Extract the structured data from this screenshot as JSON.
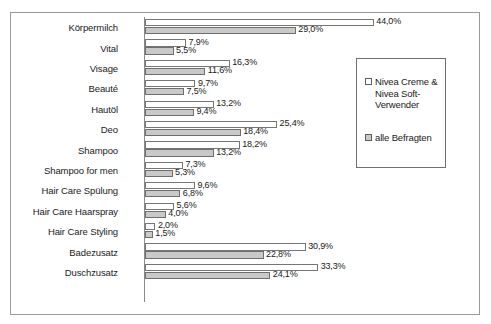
{
  "chart_data": {
    "type": "bar",
    "orientation": "horizontal",
    "title": "",
    "xlabel": "",
    "ylabel": "",
    "xlim": [
      0,
      46
    ],
    "grid": false,
    "value_suffix": "%",
    "decimal_separator": ",",
    "legend_position": "right",
    "categories": [
      "Körpermilch",
      "Vital",
      "Visage",
      "Beauté",
      "Hautöl",
      "Deo",
      "Shampoo",
      "Shampoo for men",
      "Hair Care Spülung",
      "Hair Care Haarspray",
      "Hair Care Styling",
      "Badezusatz",
      "Duschzusatz"
    ],
    "series": [
      {
        "name": "Nivea Creme & Nivea Soft-Verwender",
        "color": "#ffffff",
        "values": [
          44.0,
          7.9,
          16.3,
          9.7,
          13.2,
          25.4,
          18.2,
          7.3,
          9.6,
          5.6,
          2.0,
          30.9,
          33.3
        ],
        "labels": [
          "44,0%",
          "7,9%",
          "16,3%",
          "9,7%",
          "13,2%",
          "25,4%",
          "18,2%",
          "7,3%",
          "9,6%",
          "5,6%",
          "2,0%",
          "30,9%",
          "33,3%"
        ]
      },
      {
        "name": "alle Befragten",
        "color": "#c9c9c9",
        "values": [
          29.0,
          5.5,
          11.6,
          7.5,
          9.4,
          18.4,
          13.2,
          5.3,
          6.8,
          4.0,
          1.5,
          22.8,
          24.1
        ],
        "labels": [
          "29,0%",
          "5,5%",
          "11,6%",
          "7,5%",
          "9,4%",
          "18,4%",
          "13,2%",
          "5,3%",
          "6,8%",
          "4,0%",
          "1,5%",
          "22,8%",
          "24,1%"
        ]
      }
    ]
  },
  "legend": {
    "entries": [
      {
        "label": "Nivea Creme & Nivea Soft-Verwender"
      },
      {
        "label": "alle Befragten"
      }
    ]
  }
}
